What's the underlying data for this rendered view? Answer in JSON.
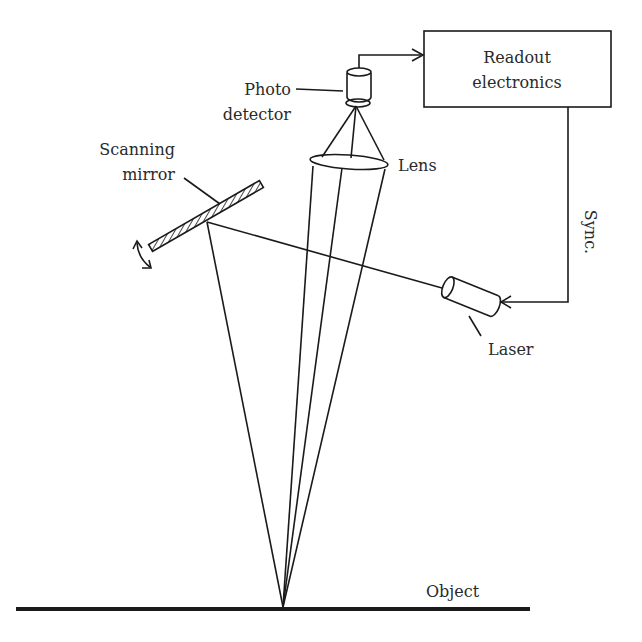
{
  "diagram": {
    "type": "laser scanning system schematic",
    "labels": {
      "readout_line1": "Readout",
      "readout_line2": "electronics",
      "photo_line1": "Photo",
      "photo_line2": "detector",
      "scanning_line1": "Scanning",
      "scanning_line2": "mirror",
      "lens": "Lens",
      "sync": "Sync.",
      "laser": "Laser",
      "object": "Object"
    },
    "components": [
      {
        "id": "readout-electronics",
        "shape": "rectangle"
      },
      {
        "id": "photo-detector",
        "shape": "cylinder"
      },
      {
        "id": "lens",
        "shape": "ellipse"
      },
      {
        "id": "scanning-mirror",
        "shape": "hatched-bar"
      },
      {
        "id": "laser",
        "shape": "cylinder"
      },
      {
        "id": "object",
        "shape": "thick-line"
      }
    ],
    "connections": [
      {
        "from": "photo-detector",
        "to": "readout-electronics",
        "arrow": true
      },
      {
        "from": "readout-electronics",
        "to": "laser",
        "label": "Sync.",
        "arrow": true
      },
      {
        "from": "laser",
        "to": "scanning-mirror",
        "type": "beam"
      },
      {
        "from": "scanning-mirror",
        "to": "object",
        "type": "beam"
      },
      {
        "from": "object",
        "to": "lens",
        "type": "collected-light"
      },
      {
        "from": "lens",
        "to": "photo-detector",
        "type": "focused-light"
      }
    ],
    "colors": {
      "line": "#1a1a1a",
      "text": "#2a2a2a",
      "background": "#ffffff"
    }
  }
}
